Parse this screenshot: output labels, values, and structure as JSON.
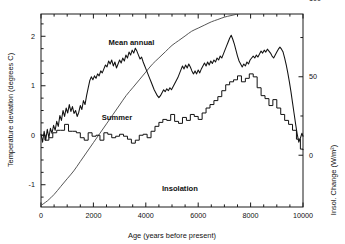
{
  "chart_data": {
    "type": "line",
    "title": "",
    "xlabel": "Age (years before present)",
    "ylabel": "Temperature deviation (degrees C)",
    "ylabel_right": "Insol. Change (W/m²)",
    "xlim": [
      0,
      10000
    ],
    "ylim": [
      -1.45,
      2.45
    ],
    "ylim_right": [
      -33,
      90
    ],
    "grid": false,
    "legend_position": "inline-annotations",
    "xticks": [
      0,
      2000,
      4000,
      6000,
      8000,
      10000
    ],
    "xticklabels": [
      "0",
      "2000",
      "4000",
      "6000",
      "8000",
      "10000"
    ],
    "yticks": [
      -1,
      0,
      1,
      2
    ],
    "yticklabels": [
      "-1",
      "0",
      "1",
      "2"
    ],
    "yticks_right": [
      0,
      50,
      100
    ],
    "yticklabels_right": [
      "0",
      "50",
      "100"
    ],
    "annotations": [
      {
        "text": "Mean annual",
        "x": 3450,
        "y": 1.82
      },
      {
        "text": "Summer",
        "x": 2900,
        "y": 0.3
      },
      {
        "text": "Insolation",
        "x": 5300,
        "y": -1.13
      }
    ],
    "series": [
      {
        "name": "Mean annual",
        "axis": "left",
        "units": "degrees C",
        "style": "jagged-line",
        "x": [
          0,
          60,
          120,
          180,
          240,
          300,
          360,
          420,
          480,
          540,
          600,
          660,
          720,
          780,
          840,
          900,
          960,
          1020,
          1080,
          1140,
          1200,
          1260,
          1320,
          1380,
          1440,
          1500,
          1560,
          1620,
          1680,
          1740,
          1800,
          1860,
          1920,
          1980,
          2040,
          2100,
          2160,
          2220,
          2280,
          2340,
          2400,
          2460,
          2520,
          2580,
          2640,
          2700,
          2760,
          2820,
          2880,
          2940,
          3000,
          3060,
          3120,
          3180,
          3240,
          3300,
          3360,
          3420,
          3480,
          3540,
          3600,
          3660,
          3720,
          3780,
          3840,
          3900,
          3960,
          4020,
          4080,
          4140,
          4200,
          4260,
          4320,
          4380,
          4440,
          4500,
          4560,
          4620,
          4680,
          4740,
          4800,
          4860,
          4920,
          4980,
          5040,
          5100,
          5160,
          5220,
          5280,
          5340,
          5400,
          5460,
          5520,
          5580,
          5640,
          5700,
          5760,
          5820,
          5880,
          5940,
          6000,
          6060,
          6120,
          6180,
          6240,
          6300,
          6360,
          6420,
          6480,
          6540,
          6600,
          6660,
          6720,
          6780,
          6840,
          6900,
          6960,
          7020,
          7080,
          7140,
          7200,
          7260,
          7320,
          7380,
          7440,
          7500,
          7560,
          7620,
          7680,
          7740,
          7800,
          7860,
          7920,
          7980,
          8040,
          8100,
          8160,
          8220,
          8280,
          8340,
          8400,
          8460,
          8520,
          8580,
          8640,
          8700,
          8760,
          8820,
          8880,
          8940,
          9000,
          9060,
          9120,
          9180,
          9240,
          9300,
          9360,
          9420,
          9480,
          9540,
          9600,
          9660,
          9720,
          9780,
          9840,
          9900,
          9960,
          10000
        ],
        "y": [
          0.02,
          -0.14,
          0.08,
          -0.1,
          0.12,
          -0.05,
          0.14,
          0.04,
          0.2,
          0.1,
          0.28,
          0.18,
          0.4,
          0.3,
          0.5,
          0.38,
          0.55,
          0.45,
          0.62,
          0.48,
          0.58,
          0.44,
          0.5,
          0.38,
          0.46,
          0.6,
          0.52,
          0.7,
          0.62,
          0.8,
          0.95,
          1.1,
          1.18,
          1.12,
          1.2,
          1.15,
          1.24,
          1.2,
          1.3,
          1.26,
          1.34,
          1.42,
          1.38,
          1.5,
          1.44,
          1.52,
          1.4,
          1.48,
          1.36,
          1.44,
          1.52,
          1.46,
          1.56,
          1.5,
          1.62,
          1.56,
          1.68,
          1.62,
          1.72,
          1.66,
          1.76,
          1.7,
          1.62,
          1.54,
          1.58,
          1.48,
          1.4,
          1.32,
          1.24,
          1.16,
          1.08,
          1.0,
          0.92,
          0.86,
          0.8,
          0.76,
          0.8,
          0.86,
          0.92,
          0.88,
          0.94,
          0.9,
          0.96,
          0.92,
          0.98,
          1.04,
          1.1,
          1.16,
          1.24,
          1.32,
          1.4,
          1.34,
          1.42,
          1.36,
          1.44,
          1.38,
          1.3,
          1.24,
          1.3,
          1.24,
          1.32,
          1.26,
          1.34,
          1.4,
          1.46,
          1.4,
          1.48,
          1.42,
          1.5,
          1.45,
          1.52,
          1.48,
          1.56,
          1.52,
          1.6,
          1.56,
          1.64,
          1.72,
          1.8,
          1.88,
          1.96,
          2.02,
          1.94,
          1.84,
          1.72,
          1.6,
          1.5,
          1.44,
          1.38,
          1.44,
          1.4,
          1.48,
          1.44,
          1.52,
          1.56,
          1.6,
          1.56,
          1.62,
          1.58,
          1.64,
          1.7,
          1.66,
          1.72,
          1.68,
          1.74,
          1.7,
          1.66,
          1.6,
          1.56,
          1.62,
          1.68,
          1.74,
          1.78,
          1.74,
          1.68,
          1.56,
          1.42,
          1.26,
          1.08,
          0.88,
          0.66,
          0.44,
          0.22,
          0.02,
          -0.14,
          -0.06,
          0.04,
          -0.02
        ]
      },
      {
        "name": "Summer",
        "axis": "left",
        "units": "degrees C",
        "style": "step-line",
        "x": [
          0,
          150,
          300,
          450,
          600,
          750,
          900,
          1050,
          1200,
          1350,
          1500,
          1650,
          1800,
          1950,
          2100,
          2250,
          2400,
          2550,
          2700,
          2850,
          3000,
          3150,
          3300,
          3450,
          3600,
          3750,
          3900,
          4050,
          4200,
          4350,
          4500,
          4650,
          4800,
          4950,
          5100,
          5250,
          5400,
          5550,
          5700,
          5850,
          6000,
          6150,
          6300,
          6450,
          6600,
          6750,
          6900,
          7050,
          7200,
          7350,
          7500,
          7650,
          7800,
          7950,
          8100,
          8250,
          8400,
          8550,
          8700,
          8850,
          9000,
          9150,
          9300,
          9450,
          9600,
          9750,
          9900,
          10000
        ],
        "y": [
          0.0,
          -0.1,
          -0.05,
          0.05,
          0.1,
          0.1,
          0.22,
          0.08,
          0.08,
          0.05,
          -0.05,
          -0.1,
          0.05,
          -0.02,
          0.0,
          -0.1,
          0.05,
          0.02,
          -0.05,
          -0.02,
          0.02,
          -0.02,
          -0.08,
          -0.16,
          -0.1,
          0.0,
          0.02,
          -0.05,
          0.08,
          0.18,
          0.26,
          0.32,
          0.3,
          0.42,
          0.28,
          0.24,
          0.36,
          0.3,
          0.42,
          0.38,
          0.32,
          0.45,
          0.55,
          0.62,
          0.7,
          0.78,
          0.9,
          1.02,
          1.08,
          1.12,
          1.2,
          1.08,
          1.15,
          1.24,
          1.18,
          0.96,
          0.8,
          0.74,
          0.6,
          0.72,
          0.55,
          0.42,
          0.3,
          0.22,
          0.1,
          -0.08,
          -0.28,
          -0.3
        ]
      },
      {
        "name": "Insolation",
        "axis": "right",
        "units": "W/m²",
        "style": "smooth-line",
        "x": [
          0,
          250,
          500,
          750,
          1000,
          1250,
          1500,
          1750,
          2000,
          2250,
          2500,
          2750,
          3000,
          3250,
          3500,
          3750,
          4000,
          4250,
          4500,
          4750,
          5000,
          5250,
          5500,
          5750,
          6000,
          6250,
          6500,
          6750,
          7000,
          7250,
          7500,
          7750,
          8000,
          8250,
          8500,
          8750,
          9000,
          9250,
          9500,
          9750,
          10000
        ],
        "y": [
          -32,
          -29,
          -25,
          -20,
          -15,
          -10,
          -4,
          2,
          8,
          14,
          20,
          26,
          32,
          38,
          43,
          48,
          53,
          58,
          62,
          66,
          70,
          73,
          76,
          79,
          81,
          83,
          85,
          86.5,
          88,
          89,
          90,
          90.8,
          91.5,
          92,
          92.4,
          92.7,
          93,
          93.1,
          93.2,
          93.2,
          93.2
        ]
      }
    ]
  }
}
